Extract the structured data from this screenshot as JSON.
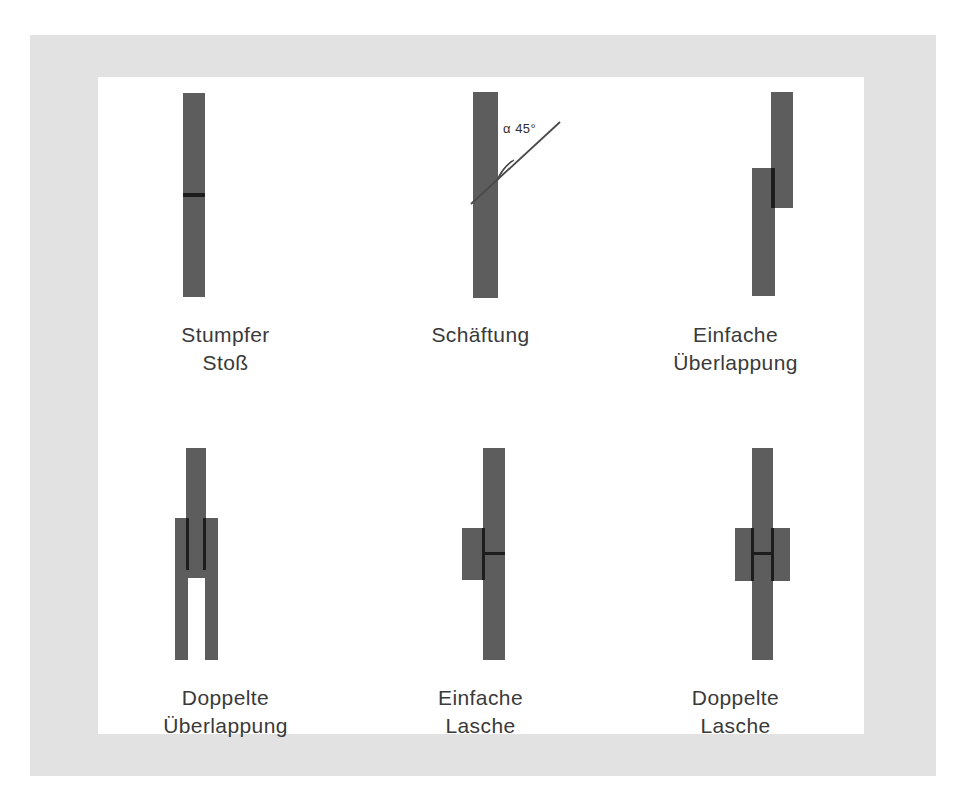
{
  "figure": {
    "background_color": "#ffffff",
    "mat_color": "#e2e2e2",
    "panel_color": "#ffffff",
    "material_color": "#5d5d5d",
    "seam_color": "#1d1d1d",
    "caption_color": "#3a3a3a"
  },
  "annotations": {
    "scarf_angle": "α 45°"
  },
  "joints": [
    {
      "id": "butt-joint",
      "caption_line1": "Stumpfer",
      "caption_line2": "Stoß"
    },
    {
      "id": "scarf-joint",
      "caption_line1": "Schäftung",
      "caption_line2": ""
    },
    {
      "id": "single-lap-joint",
      "caption_line1": "Einfache",
      "caption_line2": "Überlappung"
    },
    {
      "id": "double-lap-joint",
      "caption_line1": "Doppelte",
      "caption_line2": "Überlappung"
    },
    {
      "id": "single-strap-joint",
      "caption_line1": "Einfache",
      "caption_line2": "Lasche"
    },
    {
      "id": "double-strap-joint",
      "caption_line1": "Doppelte",
      "caption_line2": "Lasche"
    }
  ]
}
